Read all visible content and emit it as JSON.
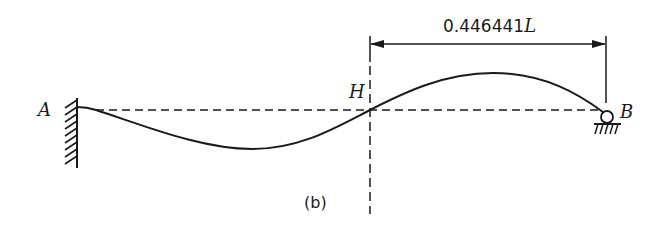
{
  "figure": {
    "caption": "(b)",
    "dimension": {
      "value": "0.446441",
      "unit": "L",
      "from_point": "H",
      "to_point": "B"
    },
    "points": {
      "left_support": "A",
      "inflection": "H",
      "right_support": "B"
    },
    "supports": {
      "left": "fixed-wall",
      "right": "roller"
    },
    "colors": {
      "stroke": "#1a1a1a",
      "background": "#ffffff"
    }
  }
}
